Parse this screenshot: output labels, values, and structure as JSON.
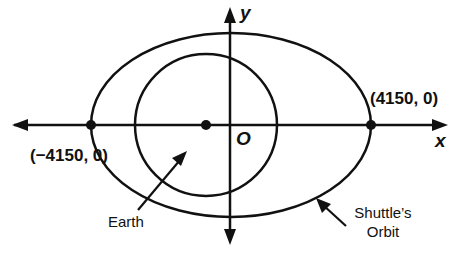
{
  "diagram": {
    "axes": {
      "x_label": "x",
      "y_label": "y",
      "origin_label": "O"
    },
    "points": [
      {
        "name": "left-vertex",
        "label": "(−4150, 0)",
        "x": -4150,
        "y": 0
      },
      {
        "name": "right-vertex",
        "label": "(4150, 0)",
        "x": 4150,
        "y": 0
      }
    ],
    "labels": {
      "earth": "Earth",
      "orbit_line1": "Shuttle’s",
      "orbit_line2": "Orbit"
    },
    "shapes": {
      "ellipse": {
        "name": "Shuttle's Orbit",
        "cx": 231,
        "cy": 125,
        "rx": 140,
        "ry": 92
      },
      "circle": {
        "name": "Earth",
        "cx": 206,
        "cy": 125,
        "r": 71
      }
    },
    "colors": {
      "ink": "#111111",
      "background": "#ffffff"
    }
  }
}
